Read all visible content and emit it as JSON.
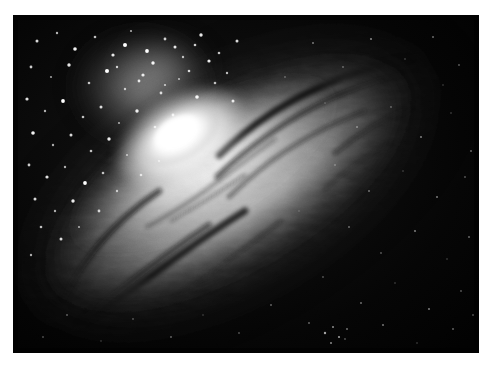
{
  "image": {
    "domain": "natural-image",
    "subject": "spiral-galaxy",
    "palette": "grayscale",
    "description": "Grayscale astronomical photograph of an inclined spiral galaxy with a brilliant white nucleus, surrounding dust lanes and a dense foreground star field",
    "background_color": "#ffffff",
    "sky_color": "#030303",
    "core_color": "#ffffff",
    "dust_lane_color": "#0d0d0d",
    "halo_color": "#9a9a9a",
    "plate": {
      "left": 13,
      "top": 15,
      "width": 466,
      "height": 338
    }
  },
  "galaxy": {
    "name": "spiral-galaxy",
    "core": {
      "cx": 168,
      "cy": 122,
      "rx": 54,
      "ry": 30
    },
    "disk": {
      "cx": 215,
      "cy": 168,
      "rx": 215,
      "ry": 86,
      "rotation_deg": -30
    },
    "halo": {
      "cx": 215,
      "cy": 168,
      "rx": 268,
      "ry": 128,
      "rotation_deg": -30
    },
    "plume": {
      "cx": 125,
      "cy": 70,
      "rx": 72,
      "ry": 62
    },
    "inclination_note": "disk tilted from upper-right to lower-left",
    "dust_lanes": [
      {
        "id": "lane-upper-1",
        "opacity": 0.85
      },
      {
        "id": "lane-upper-2",
        "opacity": 0.7
      },
      {
        "id": "lane-inner-1",
        "opacity": 0.55
      },
      {
        "id": "lane-lower-1",
        "opacity": 0.8
      },
      {
        "id": "lane-lower-2",
        "opacity": 0.65
      },
      {
        "id": "lane-outer-left",
        "opacity": 0.75
      }
    ]
  },
  "starfield": {
    "dense_region": "upper-left",
    "sparse_region": "lower-right",
    "bright_star_count": 210,
    "faint_star_count": 430
  }
}
